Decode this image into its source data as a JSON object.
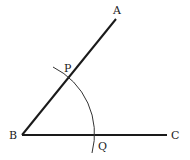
{
  "diagram": {
    "type": "geometric-construction",
    "points": {
      "A": {
        "label": "A",
        "x": 116,
        "y": 19
      },
      "B": {
        "label": "B",
        "x": 22,
        "y": 135
      },
      "C": {
        "label": "C",
        "x": 167,
        "y": 135
      },
      "P": {
        "label": "P",
        "x": 69,
        "y": 77
      },
      "Q": {
        "label": "Q",
        "x": 96,
        "y": 135
      }
    },
    "segments": [
      {
        "from": "B",
        "to": "A"
      },
      {
        "from": "B",
        "to": "C"
      }
    ],
    "arc": {
      "center": "B",
      "radius": 74.6,
      "through": [
        "P",
        "Q"
      ]
    },
    "colors": {
      "stroke": "#1a1a1a",
      "arc": "#333333",
      "background": "#ffffff"
    }
  }
}
